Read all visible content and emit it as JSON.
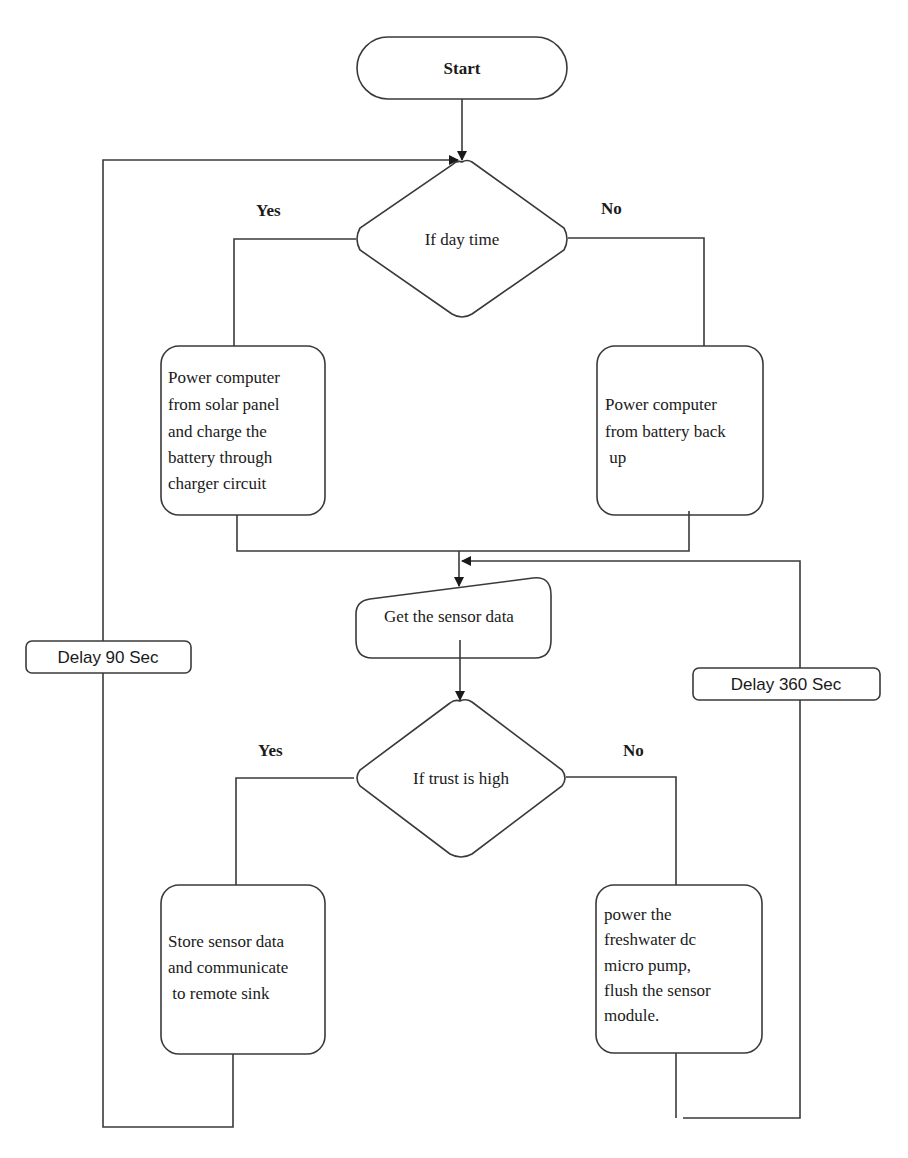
{
  "diagram": {
    "type": "flowchart",
    "start": {
      "label": "Start"
    },
    "decision_day": {
      "label": "If day time",
      "yes_label": "Yes",
      "no_label": "No"
    },
    "process_solar": {
      "lines": [
        "Power computer",
        "from solar panel",
        "and charge the",
        "battery through",
        "charger circuit"
      ]
    },
    "process_battery": {
      "lines": [
        "Power computer",
        "from battery back",
        " up"
      ]
    },
    "io_sensor": {
      "label": "Get the sensor data"
    },
    "decision_trust": {
      "label": "If trust is high",
      "yes_label": "Yes",
      "no_label": "No"
    },
    "process_store": {
      "lines": [
        "Store sensor data",
        "and communicate",
        " to remote sink"
      ]
    },
    "process_flush": {
      "lines": [
        "power the",
        "freshwater dc",
        "micro pump,",
        "flush the sensor",
        "module."
      ]
    },
    "delay_left": {
      "label": "Delay 90 Sec"
    },
    "delay_right": {
      "label": "Delay 360 Sec"
    },
    "colors": {
      "stroke": "#3a3a3a",
      "background": "#ffffff",
      "text": "#1a1a1a"
    }
  }
}
